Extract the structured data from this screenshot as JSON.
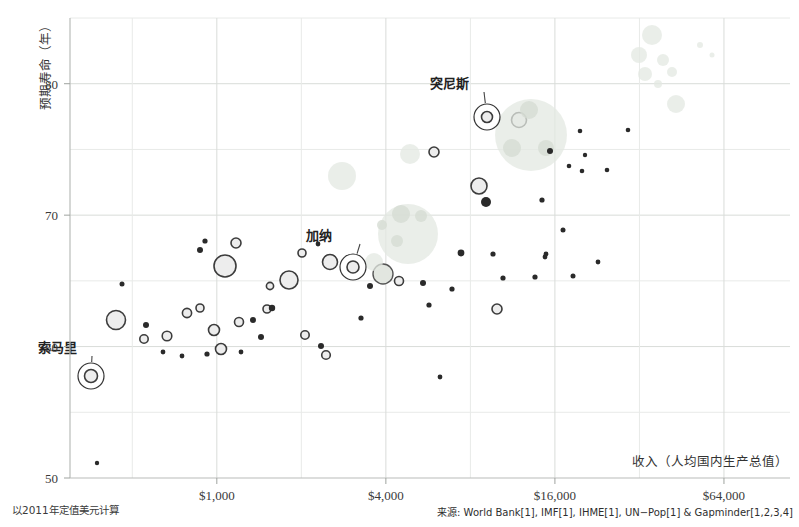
{
  "chart_data": {
    "type": "scatter",
    "title": "",
    "xlabel": "收入（人均国内生产总值）",
    "ylabel": "预期寿命（年）",
    "xscale": "log",
    "xlim": [
      300,
      110000
    ],
    "ylim": [
      50,
      85
    ],
    "grid": true,
    "legend": "none",
    "xticks": [
      {
        "value": 1000,
        "label": "$1,000"
      },
      {
        "value": 4000,
        "label": "$4,000"
      },
      {
        "value": 16000,
        "label": "$16,000"
      },
      {
        "value": 64000,
        "label": "$64,000"
      }
    ],
    "yticks": [
      {
        "value": 50,
        "label": "50"
      },
      {
        "value": 60,
        "label": "60"
      },
      {
        "value": 70,
        "label": "70"
      },
      {
        "value": 80,
        "label": "80"
      }
    ],
    "y_minor_gridlines": [
      55,
      65,
      75,
      85
    ],
    "x_minor_gridlines": [
      500,
      2000,
      8000,
      32000
    ],
    "footnote": "以2011年定值美元计算",
    "source": "来源: World Bank[1], IMF[1], IHME[1], UN−Pop[1] & Gapminder[1,2,3,4]",
    "annotations": [
      {
        "label": "索马里",
        "label_x": 38,
        "label_y": 352,
        "point_x": 91,
        "point_y": 376,
        "halo_r": 13
      },
      {
        "label": "加纳",
        "label_x": 306,
        "label_y": 240,
        "point_x": 353,
        "point_y": 267,
        "halo_r": 13
      },
      {
        "label": "突尼斯",
        "label_x": 430,
        "label_y": 88,
        "point_x": 487,
        "point_y": 117,
        "halo_r": 13
      }
    ],
    "bubble_style": {
      "outlined_stroke": "#3c3c3c",
      "outlined_fill": "#ededed",
      "faint_fill": "#e3e8e1",
      "faint_stroke": "none",
      "dot_fill": "#2a2a2a"
    },
    "points": [
      {
        "cx": 91,
        "cy": 376,
        "r": 6.5,
        "kind": "outlined"
      },
      {
        "cx": 116,
        "cy": 320,
        "r": 9.5,
        "kind": "outlined"
      },
      {
        "cx": 122,
        "cy": 284,
        "r": 2.5,
        "kind": "dot"
      },
      {
        "cx": 97,
        "cy": 463,
        "r": 2.2,
        "kind": "dot"
      },
      {
        "cx": 146,
        "cy": 325,
        "r": 3.0,
        "kind": "dot"
      },
      {
        "cx": 144,
        "cy": 339,
        "r": 4.2,
        "kind": "outlined"
      },
      {
        "cx": 167,
        "cy": 336,
        "r": 4.8,
        "kind": "outlined"
      },
      {
        "cx": 163,
        "cy": 352,
        "r": 2.4,
        "kind": "dot"
      },
      {
        "cx": 182,
        "cy": 356,
        "r": 2.4,
        "kind": "dot"
      },
      {
        "cx": 187,
        "cy": 313,
        "r": 4.6,
        "kind": "outlined"
      },
      {
        "cx": 200,
        "cy": 308,
        "r": 4.0,
        "kind": "outlined"
      },
      {
        "cx": 200,
        "cy": 250,
        "r": 3.0,
        "kind": "dot"
      },
      {
        "cx": 205,
        "cy": 241,
        "r": 2.6,
        "kind": "dot"
      },
      {
        "cx": 214,
        "cy": 330,
        "r": 5.5,
        "kind": "outlined"
      },
      {
        "cx": 225,
        "cy": 266,
        "r": 11.0,
        "kind": "outlined"
      },
      {
        "cx": 236,
        "cy": 243,
        "r": 5.0,
        "kind": "outlined"
      },
      {
        "cx": 221,
        "cy": 349,
        "r": 5.5,
        "kind": "outlined"
      },
      {
        "cx": 239,
        "cy": 322,
        "r": 4.5,
        "kind": "outlined"
      },
      {
        "cx": 241,
        "cy": 352,
        "r": 2.4,
        "kind": "dot"
      },
      {
        "cx": 207,
        "cy": 354,
        "r": 2.6,
        "kind": "dot"
      },
      {
        "cx": 253,
        "cy": 320,
        "r": 3.0,
        "kind": "dot"
      },
      {
        "cx": 267,
        "cy": 309,
        "r": 4.0,
        "kind": "outlined"
      },
      {
        "cx": 261,
        "cy": 337,
        "r": 3.0,
        "kind": "dot"
      },
      {
        "cx": 272,
        "cy": 308,
        "r": 3.2,
        "kind": "dot"
      },
      {
        "cx": 289,
        "cy": 280,
        "r": 9.0,
        "kind": "outlined"
      },
      {
        "cx": 270,
        "cy": 286,
        "r": 3.6,
        "kind": "outlined"
      },
      {
        "cx": 302,
        "cy": 253,
        "r": 4.0,
        "kind": "outlined"
      },
      {
        "cx": 305,
        "cy": 335,
        "r": 4.2,
        "kind": "outlined"
      },
      {
        "cx": 321,
        "cy": 346,
        "r": 3.0,
        "kind": "dot"
      },
      {
        "cx": 326,
        "cy": 355,
        "r": 4.3,
        "kind": "outlined"
      },
      {
        "cx": 330,
        "cy": 262,
        "r": 7.5,
        "kind": "outlined"
      },
      {
        "cx": 342,
        "cy": 176,
        "r": 14.0,
        "kind": "faint"
      },
      {
        "cx": 318,
        "cy": 244,
        "r": 2.4,
        "kind": "dot"
      },
      {
        "cx": 353,
        "cy": 267,
        "r": 6.0,
        "kind": "outlined"
      },
      {
        "cx": 370,
        "cy": 286,
        "r": 3.0,
        "kind": "dot"
      },
      {
        "cx": 361,
        "cy": 318,
        "r": 2.6,
        "kind": "dot"
      },
      {
        "cx": 383,
        "cy": 274,
        "r": 10.0,
        "kind": "outlined-light"
      },
      {
        "cx": 399,
        "cy": 281,
        "r": 4.5,
        "kind": "outlined"
      },
      {
        "cx": 408,
        "cy": 234,
        "r": 30.0,
        "kind": "faint"
      },
      {
        "cx": 401,
        "cy": 214,
        "r": 9.0,
        "kind": "faint-d"
      },
      {
        "cx": 421,
        "cy": 216,
        "r": 6.0,
        "kind": "faint-d"
      },
      {
        "cx": 397,
        "cy": 241,
        "r": 6.0,
        "kind": "faint-d"
      },
      {
        "cx": 382,
        "cy": 225,
        "r": 5.0,
        "kind": "faint-d"
      },
      {
        "cx": 374,
        "cy": 262,
        "r": 9.0,
        "kind": "faint"
      },
      {
        "cx": 410,
        "cy": 154,
        "r": 10.0,
        "kind": "faint"
      },
      {
        "cx": 423,
        "cy": 283,
        "r": 3.0,
        "kind": "dot"
      },
      {
        "cx": 429,
        "cy": 305,
        "r": 2.6,
        "kind": "dot"
      },
      {
        "cx": 434,
        "cy": 152,
        "r": 5.0,
        "kind": "outlined"
      },
      {
        "cx": 440,
        "cy": 377,
        "r": 2.4,
        "kind": "dot"
      },
      {
        "cx": 452,
        "cy": 289,
        "r": 2.6,
        "kind": "dot"
      },
      {
        "cx": 461,
        "cy": 253,
        "r": 3.4,
        "kind": "dot"
      },
      {
        "cx": 487,
        "cy": 117,
        "r": 5.5,
        "kind": "outlined"
      },
      {
        "cx": 486,
        "cy": 202,
        "r": 5.0,
        "kind": "dot"
      },
      {
        "cx": 497,
        "cy": 309,
        "r": 5.0,
        "kind": "outlined"
      },
      {
        "cx": 503,
        "cy": 278,
        "r": 2.6,
        "kind": "dot"
      },
      {
        "cx": 479,
        "cy": 186,
        "r": 8.0,
        "kind": "outlined"
      },
      {
        "cx": 493,
        "cy": 254,
        "r": 2.6,
        "kind": "dot"
      },
      {
        "cx": 519,
        "cy": 120,
        "r": 7.5,
        "kind": "outlined"
      },
      {
        "cx": 531,
        "cy": 135,
        "r": 36.0,
        "kind": "faint"
      },
      {
        "cx": 529,
        "cy": 110,
        "r": 9.0,
        "kind": "faint-d"
      },
      {
        "cx": 512,
        "cy": 148,
        "r": 9.0,
        "kind": "faint-d"
      },
      {
        "cx": 546,
        "cy": 148,
        "r": 8.0,
        "kind": "faint-d"
      },
      {
        "cx": 550,
        "cy": 151,
        "r": 3.0,
        "kind": "dot"
      },
      {
        "cx": 569,
        "cy": 166,
        "r": 2.3,
        "kind": "dot"
      },
      {
        "cx": 542,
        "cy": 200,
        "r": 2.6,
        "kind": "dot"
      },
      {
        "cx": 545,
        "cy": 257,
        "r": 2.4,
        "kind": "dot"
      },
      {
        "cx": 535,
        "cy": 277,
        "r": 2.6,
        "kind": "dot"
      },
      {
        "cx": 563,
        "cy": 230,
        "r": 2.5,
        "kind": "dot"
      },
      {
        "cx": 573,
        "cy": 276,
        "r": 2.5,
        "kind": "dot"
      },
      {
        "cx": 546,
        "cy": 254,
        "r": 2.4,
        "kind": "dot"
      },
      {
        "cx": 582,
        "cy": 171,
        "r": 2.3,
        "kind": "dot"
      },
      {
        "cx": 580,
        "cy": 131,
        "r": 2.3,
        "kind": "dot"
      },
      {
        "cx": 585,
        "cy": 155,
        "r": 2.2,
        "kind": "dot"
      },
      {
        "cx": 598,
        "cy": 262,
        "r": 2.4,
        "kind": "dot"
      },
      {
        "cx": 607,
        "cy": 170,
        "r": 2.3,
        "kind": "dot"
      },
      {
        "cx": 628,
        "cy": 130,
        "r": 2.3,
        "kind": "dot"
      },
      {
        "cx": 652,
        "cy": 35,
        "r": 10.0,
        "kind": "faint"
      },
      {
        "cx": 639,
        "cy": 55,
        "r": 8.0,
        "kind": "faint"
      },
      {
        "cx": 645,
        "cy": 74,
        "r": 7.0,
        "kind": "faint"
      },
      {
        "cx": 663,
        "cy": 60,
        "r": 6.0,
        "kind": "faint"
      },
      {
        "cx": 672,
        "cy": 72,
        "r": 5.0,
        "kind": "faint"
      },
      {
        "cx": 676,
        "cy": 104,
        "r": 9.0,
        "kind": "faint"
      },
      {
        "cx": 700,
        "cy": 45,
        "r": 3.0,
        "kind": "faint"
      },
      {
        "cx": 712,
        "cy": 55,
        "r": 2.5,
        "kind": "faint"
      },
      {
        "cx": 658,
        "cy": 84,
        "r": 4.0,
        "kind": "faint"
      }
    ]
  }
}
